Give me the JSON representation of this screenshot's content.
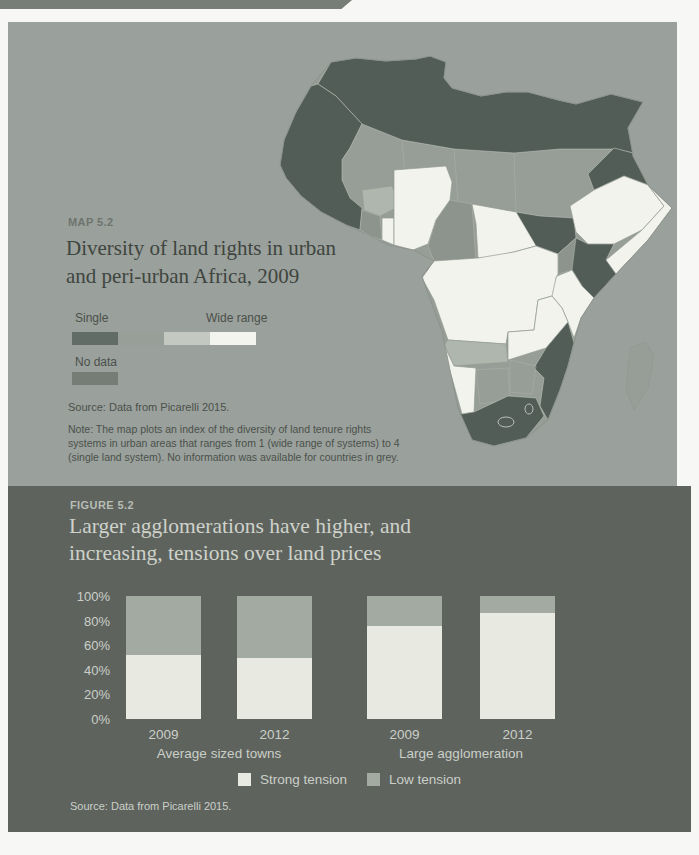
{
  "colors": {
    "page_edge": "#777d77",
    "map_bg": "#9aa09b",
    "map_kicker": "#6e746e",
    "map_title": "#3f453f",
    "map_text": "#4b514b",
    "fig_bg": "#5e635e",
    "fig_kicker": "#b7bcb5",
    "fig_title": "#ced2ca",
    "fig_text": "#cbcfc8",
    "map_class_single": "#525d57",
    "map_class_2": "#8c948d",
    "map_class_3": "#afb6ad",
    "map_class_wide": "#f2f3ec",
    "map_no_data": "#979d97"
  },
  "map_panel": {
    "kicker": "MAP 5.2",
    "title_line1": "Diversity of land rights in urban",
    "title_line2": "and peri-urban Africa, 2009",
    "legend": {
      "single_label": "Single",
      "wide_label": "Wide range",
      "no_data_label": "No data",
      "scale_colors": [
        "#626c66",
        "#989f99",
        "#c3c8c0",
        "#f3f4ee"
      ],
      "no_data_color": "#767d77"
    },
    "source": "Source: Data from Picarelli 2015.",
    "note_lines": [
      "Note: The map plots an index of the diversity of land tenure rights",
      "systems in urban areas that ranges from 1 (wide range of systems) to 4",
      "(single land system). No information was available for countries in grey."
    ]
  },
  "figure_panel": {
    "kicker": "FIGURE 5.2",
    "title_line1": "Larger agglomerations have higher, and",
    "title_line2": "increasing, tensions over land prices",
    "source": "Source: Data from Picarelli 2015."
  },
  "chart_data": {
    "type": "bar",
    "stacked": true,
    "categories": [
      "2009",
      "2012",
      "2009",
      "2012"
    ],
    "groups": [
      {
        "label": "Average sized towns",
        "bar_indexes": [
          0,
          1
        ]
      },
      {
        "label": "Large agglomeration",
        "bar_indexes": [
          2,
          3
        ]
      }
    ],
    "series": [
      {
        "name": "Strong tension",
        "color": "#e8eae1",
        "values": [
          52,
          50,
          76,
          86
        ]
      },
      {
        "name": "Low tension",
        "color": "#a3aaa2",
        "values": [
          48,
          50,
          24,
          14
        ]
      }
    ],
    "y_ticks": [
      "100%",
      "80%",
      "60%",
      "40%",
      "20%",
      "0%"
    ],
    "ylim": [
      0,
      100
    ],
    "grid": false,
    "legend_position": "bottom"
  }
}
